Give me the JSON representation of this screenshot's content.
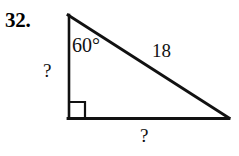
{
  "figure": {
    "problem_number": "32.",
    "shape": "right-triangle",
    "angle_label": "60°",
    "hypotenuse_label": "18",
    "leg_left_label": "?",
    "leg_bottom_label": "?",
    "right_angle_marker": "square",
    "stroke_color": "#111111",
    "background_color": "#ffffff",
    "geometry": {
      "apex": [
        68,
        15
      ],
      "right_angle_vertex": [
        68,
        118
      ],
      "base_right_vertex": [
        228,
        118
      ],
      "right_angle_square_size": 16
    }
  }
}
